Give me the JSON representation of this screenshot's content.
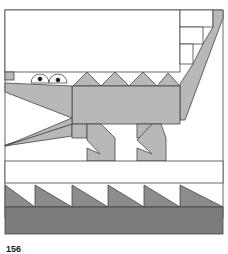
{
  "figure": {
    "caption": "156",
    "colors": {
      "background": "#ffffff",
      "light_gray": "#b8b8b8",
      "dark_gray": "#8c8c8c",
      "outline": "#444444"
    }
  }
}
